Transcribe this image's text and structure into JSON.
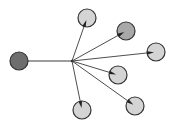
{
  "diagram": {
    "type": "star-network",
    "colors": {
      "background": "#ffffff",
      "edge": "#3a3a3a",
      "hub_fill": "#6e6e6e",
      "leaf_fill": "#d4d4d4",
      "leaf_fill_dark": "#a8a8a8",
      "node_stroke": "#333333",
      "arrow": "#222222"
    },
    "hub": {
      "id": "hub",
      "x": 19,
      "y": 61,
      "r": 9
    },
    "junction": {
      "x": 72,
      "y": 61
    },
    "leaves": [
      {
        "id": "leaf-1",
        "x": 87,
        "y": 18,
        "r": 9,
        "shade": "light"
      },
      {
        "id": "leaf-2",
        "x": 126,
        "y": 31,
        "r": 9,
        "shade": "dark"
      },
      {
        "id": "leaf-3",
        "x": 156,
        "y": 52,
        "r": 9,
        "shade": "light"
      },
      {
        "id": "leaf-4",
        "x": 118,
        "y": 75,
        "r": 9,
        "shade": "light"
      },
      {
        "id": "leaf-5",
        "x": 135,
        "y": 106,
        "r": 9,
        "shade": "light"
      },
      {
        "id": "leaf-6",
        "x": 82,
        "y": 110,
        "r": 9,
        "shade": "light"
      }
    ]
  }
}
